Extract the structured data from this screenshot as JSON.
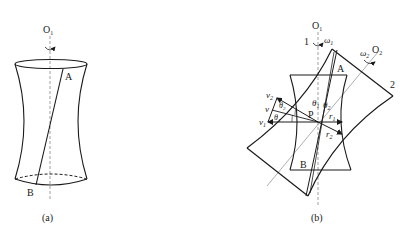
{
  "figure_a": {
    "caption": "(a)",
    "axis_label": "O",
    "axis_sub": "1",
    "point_top": "A",
    "point_bottom": "B"
  },
  "figure_b": {
    "caption": "(b)",
    "axis1_label": "O",
    "axis1_sub": "1",
    "axis2_label": "O",
    "axis2_sub": "2",
    "body1_label": "1",
    "body2_label": "2",
    "omega1": "ω",
    "omega1_sub": "1",
    "omega2": "ω",
    "omega2_sub": "2",
    "point_a": "A",
    "point_b": "B",
    "point_p": "P",
    "theta": "θ",
    "theta1_sub": "1",
    "theta2_sub": "2",
    "v": "v",
    "v1_sub": "1",
    "v2_sub": "2",
    "r": "r",
    "r1_sub": "1",
    "r2_sub": "2"
  },
  "colors": {
    "stroke": "#1a1a1a",
    "axis": "#777777",
    "background": "#ffffff"
  }
}
